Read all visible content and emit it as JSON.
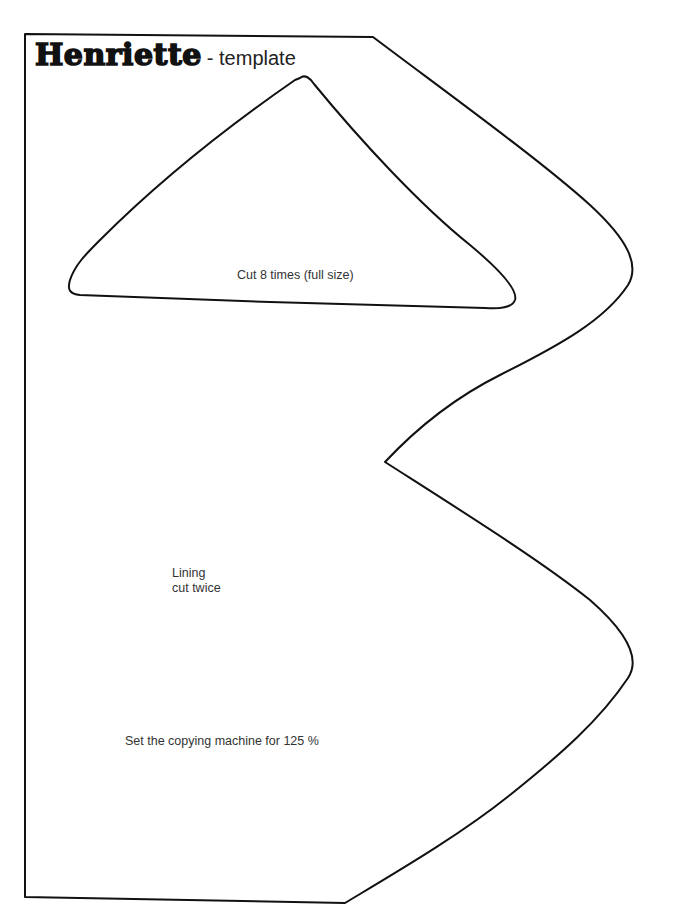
{
  "title": {
    "name": "Henriette",
    "suffix": "- template"
  },
  "pieces": {
    "triangle": {
      "label": "Cut 8 times (full size)"
    },
    "lining": {
      "line1": "Lining",
      "line2": "cut twice"
    }
  },
  "instructions": {
    "copy_note": "Set the copying machine for 125 %"
  },
  "colors": {
    "outline": "#111111",
    "text": "#333333",
    "background": "#ffffff"
  }
}
